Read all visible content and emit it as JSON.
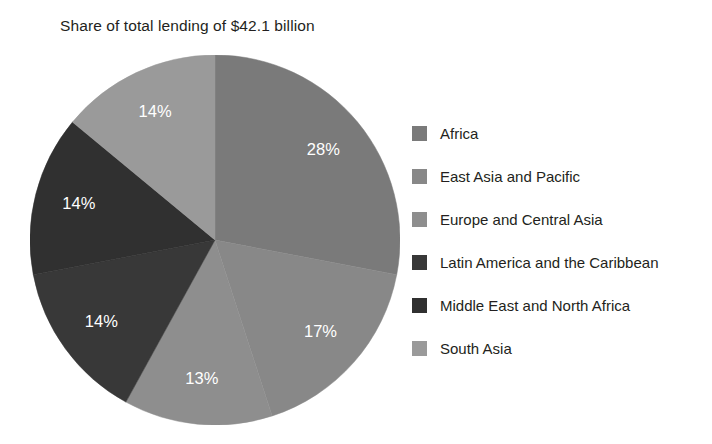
{
  "chart_data": {
    "type": "pie",
    "title": "Share of total lending of $42.1 billion",
    "subtitle": "",
    "xlabel": "",
    "ylabel": "",
    "total_label": "$42.1 billion",
    "unit": "%",
    "legend_position": "right",
    "grid": false,
    "start_angle_deg": 0,
    "direction": "clockwise",
    "categories": [
      "Africa",
      "East Asia and Pacific",
      "Europe and Central Asia",
      "Latin America and the Caribbean",
      "Middle East and North Africa",
      "South Asia"
    ],
    "values": [
      28,
      17,
      13,
      14,
      14,
      14
    ],
    "data_labels": [
      "28%",
      "17%",
      "13%",
      "14%",
      "14%",
      "14%"
    ],
    "colors": [
      "#7a7a7a",
      "#888888",
      "#8e8e8e",
      "#383838",
      "#303030",
      "#9a9a9a"
    ],
    "slices": [
      {
        "label": "Africa",
        "value": 28,
        "display": "28%",
        "color": "#7a7a7a"
      },
      {
        "label": "East Asia and Pacific",
        "value": 17,
        "display": "17%",
        "color": "#888888"
      },
      {
        "label": "Europe and Central Asia",
        "value": 13,
        "display": "13%",
        "color": "#8e8e8e"
      },
      {
        "label": "Latin America and the Caribbean",
        "value": 14,
        "display": "14%",
        "color": "#383838"
      },
      {
        "label": "Middle East and North Africa",
        "value": 14,
        "display": "14%",
        "color": "#303030"
      },
      {
        "label": "South Asia",
        "value": 14,
        "display": "14%",
        "color": "#9a9a9a"
      }
    ]
  },
  "legend": {
    "items": [
      {
        "label": "Africa",
        "color": "#7a7a7a"
      },
      {
        "label": "East Asia and Pacific",
        "color": "#888888"
      },
      {
        "label": "Europe and Central Asia",
        "color": "#8e8e8e"
      },
      {
        "label": "Latin America and the Caribbean",
        "color": "#383838"
      },
      {
        "label": "Middle East and North Africa",
        "color": "#303030"
      },
      {
        "label": "South Asia",
        "color": "#9a9a9a"
      }
    ]
  },
  "style": {
    "background": "#ffffff",
    "text_color": "#231f20",
    "label_color": "#ffffff"
  }
}
